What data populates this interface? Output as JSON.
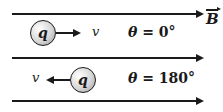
{
  "field": {
    "label": "B",
    "vector": true,
    "direction": "right"
  },
  "cases": [
    {
      "charge_label": "q",
      "velocity_label": "v",
      "velocity_direction": "right",
      "angle_text": "θ = 0°",
      "angle_symbol": "θ",
      "angle_value": "= 0°"
    },
    {
      "charge_label": "q",
      "velocity_label": "v",
      "velocity_direction": "left",
      "angle_text": "θ = 180°",
      "angle_symbol": "θ",
      "angle_value": "= 180°"
    }
  ],
  "field_lines": 3
}
